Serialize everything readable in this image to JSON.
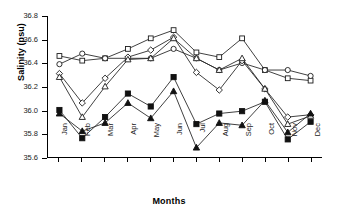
{
  "chart_data": {
    "type": "line",
    "title": "",
    "xlabel": "Months",
    "ylabel": "Salinity (psu)",
    "categories": [
      "Jan",
      "Feb",
      "Mar",
      "Apr",
      "May",
      "Jun",
      "Jul",
      "Aug",
      "Sep",
      "Oct",
      "Nov",
      "Dec"
    ],
    "ylim": [
      35.6,
      36.8
    ],
    "yticks": [
      "36.8",
      "36.6",
      "36.4",
      "36.2",
      "36.0",
      "35.8",
      "35.6"
    ],
    "ytick_values": [
      36.8,
      36.6,
      36.4,
      36.2,
      36.0,
      35.8,
      35.6
    ],
    "grid": false,
    "legend": "none",
    "series": [
      {
        "name": "Series 1",
        "marker": "open-square",
        "values": [
          36.46,
          36.42,
          36.44,
          36.52,
          36.61,
          36.68,
          36.49,
          36.45,
          36.61,
          36.34,
          36.27,
          36.25
        ]
      },
      {
        "name": "Series 2",
        "marker": "open-circle",
        "values": [
          36.39,
          36.48,
          36.44,
          36.44,
          36.44,
          36.52,
          36.44,
          36.34,
          36.4,
          36.34,
          36.34,
          36.29
        ]
      },
      {
        "name": "Series 3",
        "marker": "open-diamond",
        "values": [
          36.31,
          36.06,
          36.27,
          36.45,
          36.51,
          36.62,
          36.32,
          36.17,
          36.42,
          36.18,
          35.94,
          35.96
        ]
      },
      {
        "name": "Series 4",
        "marker": "open-triangle",
        "values": [
          36.28,
          35.94,
          36.2,
          36.43,
          36.44,
          36.61,
          36.44,
          36.34,
          36.44,
          36.18,
          35.88,
          35.95
        ]
      },
      {
        "name": "Series 5",
        "marker": "filled-square",
        "values": [
          36.0,
          35.76,
          35.94,
          36.14,
          36.03,
          36.28,
          35.88,
          35.97,
          35.99,
          36.07,
          35.75,
          35.9
        ]
      },
      {
        "name": "Series 6",
        "marker": "filled-triangle",
        "values": [
          35.97,
          35.82,
          35.89,
          36.06,
          35.93,
          36.16,
          35.68,
          35.89,
          35.87,
          36.08,
          35.81,
          35.97
        ]
      }
    ]
  }
}
